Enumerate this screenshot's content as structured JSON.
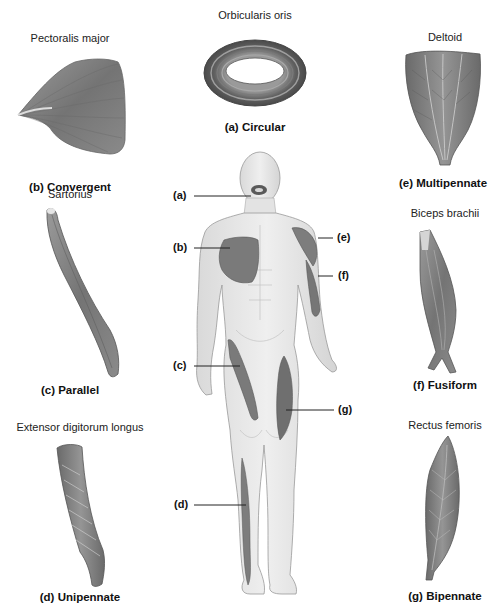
{
  "figure": {
    "panels": [
      {
        "key": "a",
        "muscle": "Orbicularis oris",
        "label": "(a) Circular"
      },
      {
        "key": "b",
        "muscle": "Pectoralis major",
        "label": "(b) Convergent"
      },
      {
        "key": "c",
        "muscle": "Sartorius",
        "label": "(c) Parallel"
      },
      {
        "key": "d",
        "muscle": "Extensor digitorum longus",
        "label": "(d) Unipennate"
      },
      {
        "key": "e",
        "muscle": "Deltoid",
        "label": "(e) Multipennate"
      },
      {
        "key": "f",
        "muscle": "Biceps brachii",
        "label": "(f) Fusiform"
      },
      {
        "key": "g",
        "muscle": "Rectus femoris",
        "label": "(g) Bipennate"
      }
    ],
    "body_callouts": [
      {
        "key": "a",
        "text": "(a)"
      },
      {
        "key": "b",
        "text": "(b)"
      },
      {
        "key": "c",
        "text": "(c)"
      },
      {
        "key": "d",
        "text": "(d)"
      },
      {
        "key": "e",
        "text": "(e)"
      },
      {
        "key": "f",
        "text": "(f)"
      },
      {
        "key": "g",
        "text": "(g)"
      }
    ],
    "colors": {
      "muscle_dark": "#6b6b6b",
      "muscle_mid": "#8c8c8c",
      "muscle_light": "#bdbdbd",
      "skin": "#e6e6e6",
      "skin_outline": "#9a9a9a",
      "leader_line": "#222222"
    }
  }
}
